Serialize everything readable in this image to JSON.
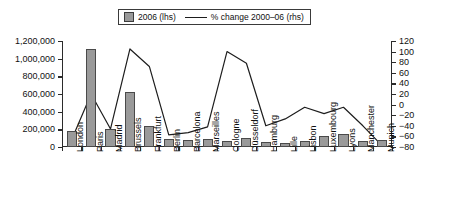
{
  "legend": {
    "items": [
      {
        "key": "bar-series",
        "label": "2006 (lhs)",
        "marker": "square-swatch",
        "color": "#9a9a9a"
      },
      {
        "key": "line-series",
        "label": "% change 2000–06 (rhs)",
        "marker": "line-key",
        "color": "#1d1d1d"
      }
    ]
  },
  "axes": {
    "left_ticks": [
      "0",
      "200,000",
      "400,000",
      "600,000",
      "800,000",
      "1,000,000",
      "1,200,000"
    ],
    "right_ticks": [
      "−80",
      "−60",
      "−40",
      "−20",
      "0",
      "20",
      "40",
      "60",
      "80",
      "100",
      "120"
    ]
  },
  "chart_data": {
    "type": "bar",
    "title": "",
    "subtitle": "",
    "xlabel": "",
    "ylabel": "",
    "y2label": "",
    "grid": false,
    "legend_position": "top-center",
    "categories": [
      "London",
      "Paris",
      "Madrid",
      "Brussels",
      "Frankfurt",
      "Berlin",
      "Barcelona",
      "Marseilles",
      "Cologne",
      "Düsseldorf",
      "Hamburg",
      "Lille",
      "Lisbon",
      "Luxembourg",
      "Lyons",
      "Manchester",
      "Munich"
    ],
    "ylim": [
      0,
      1200000
    ],
    "y2lim": [
      -80,
      120
    ],
    "series": [
      {
        "name": "2006 (lhs)",
        "type": "bar",
        "axis": "left",
        "color": "#9a9a9a",
        "values": [
          180000,
          1110000,
          205000,
          620000,
          240000,
          90000,
          75000,
          90000,
          72000,
          100000,
          55000,
          48000,
          65000,
          125000,
          142000,
          63000,
          75000
        ]
      },
      {
        "name": "% change 2000–06 (rhs)",
        "type": "line",
        "axis": "right",
        "color": "#1d1d1d",
        "values": [
          -66,
          20,
          -46,
          105,
          72,
          -57,
          -53,
          -42,
          100,
          78,
          -40,
          -27,
          -5,
          -17,
          -5,
          -40,
          -78
        ]
      }
    ]
  }
}
